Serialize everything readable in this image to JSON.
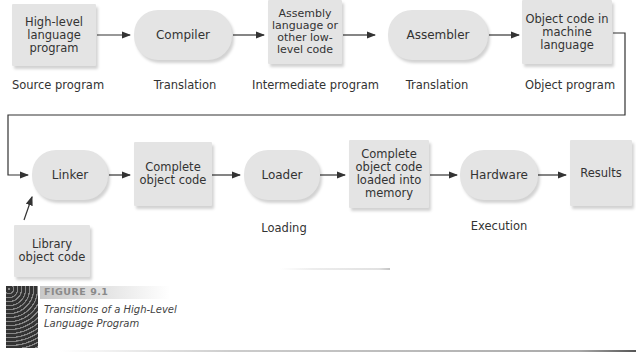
{
  "figure": {
    "number": "FIGURE 9.1",
    "caption": "Transitions of a High-Level Language Program"
  },
  "row1": {
    "nodes": [
      {
        "id": "high-level",
        "shape": "rect",
        "text": "High-level language program"
      },
      {
        "id": "compiler",
        "shape": "pill",
        "text": "Compiler"
      },
      {
        "id": "assembly",
        "shape": "rect",
        "text": "Assembly language or other low-level code"
      },
      {
        "id": "assembler",
        "shape": "pill",
        "text": "Assembler"
      },
      {
        "id": "object-code",
        "shape": "rect",
        "text": "Object code in machine language"
      }
    ],
    "labels": [
      "Source program",
      "Translation",
      "Intermediate program",
      "Translation",
      "Object program"
    ]
  },
  "row2": {
    "nodes": [
      {
        "id": "linker",
        "shape": "pill",
        "text": "Linker"
      },
      {
        "id": "complete-object",
        "shape": "rect",
        "text": "Complete object code"
      },
      {
        "id": "loader",
        "shape": "pill",
        "text": "Loader"
      },
      {
        "id": "loaded-memory",
        "shape": "rect",
        "text": "Complete object code loaded into memory"
      },
      {
        "id": "hardware",
        "shape": "pill",
        "text": "Hardware"
      },
      {
        "id": "results",
        "shape": "rect",
        "text": "Results"
      }
    ],
    "labels": [
      "Loading",
      "Execution"
    ]
  },
  "library": {
    "text": "Library object code"
  }
}
